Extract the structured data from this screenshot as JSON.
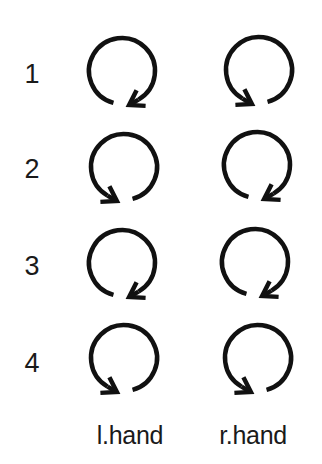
{
  "rows": [
    {
      "label": "1",
      "left": "clockwise",
      "right": "counterclockwise"
    },
    {
      "label": "2",
      "left": "counterclockwise",
      "right": "clockwise"
    },
    {
      "label": "3",
      "left": "clockwise",
      "right": "clockwise"
    },
    {
      "label": "4",
      "left": "counterclockwise",
      "right": "counterclockwise"
    }
  ],
  "columns": {
    "left": "l.hand",
    "right": "r.hand"
  },
  "geometry": {
    "radius": 33,
    "stroke_width": 4.5,
    "stroke_color": "#111111",
    "centers": [
      {
        "left": [
          122,
          71
        ],
        "right": [
          259,
          70
        ]
      },
      {
        "left": [
          124,
          167
        ],
        "right": [
          257,
          165
        ]
      },
      {
        "left": [
          122,
          263
        ],
        "right": [
          255,
          262
        ]
      },
      {
        "left": [
          124,
          358
        ],
        "right": [
          258,
          358
        ]
      }
    ]
  }
}
